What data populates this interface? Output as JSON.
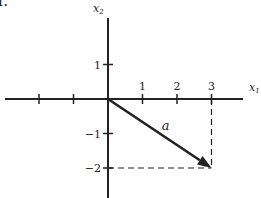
{
  "problem_number": "1.",
  "axes": {
    "x_label": "x",
    "x_label_sub": "1",
    "y_label": "x",
    "y_label_sub": "2",
    "x_range": [
      -3,
      4
    ],
    "y_range": [
      -3,
      3
    ],
    "x_ticks": [
      {
        "value": -2,
        "label": ""
      },
      {
        "value": -1,
        "label": ""
      },
      {
        "value": 1,
        "label": "1"
      },
      {
        "value": 2,
        "label": "2"
      },
      {
        "value": 3,
        "label": "3"
      }
    ],
    "y_ticks": [
      {
        "value": 1,
        "label": "1"
      },
      {
        "value": -1,
        "label": "−1"
      },
      {
        "value": -2,
        "label": "−2"
      }
    ]
  },
  "vector": {
    "label": "a",
    "from": [
      0,
      0
    ],
    "to": [
      3,
      -2
    ]
  },
  "projection_lines": [
    {
      "from": [
        3,
        0
      ],
      "to": [
        3,
        -2
      ],
      "style": "dashed"
    },
    {
      "from": [
        0,
        -2
      ],
      "to": [
        3,
        -2
      ],
      "style": "dashed"
    }
  ],
  "colors": {
    "ink": "#222222",
    "background": "#ffffff"
  }
}
